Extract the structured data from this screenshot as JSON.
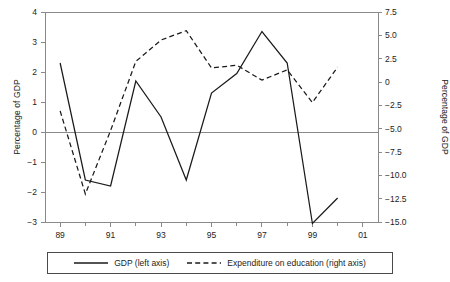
{
  "chart_data": {
    "type": "line",
    "title": "",
    "xlabel": "",
    "ylabel": "Percentage of GDP",
    "y2label": "Percentage of GDP",
    "grid": false,
    "legend_position": "bottom",
    "x": [
      1989,
      1990,
      1991,
      1992,
      1993,
      1994,
      1995,
      1996,
      1997,
      1998,
      1999,
      2000,
      2001
    ],
    "x_tick_labels": [
      "89",
      "91",
      "93",
      "95",
      "97",
      "99",
      "01"
    ],
    "x_tick_values": [
      1989,
      1991,
      1993,
      1995,
      1997,
      1999,
      2001
    ],
    "x_minor_tick_values": [
      1990,
      1992,
      1994,
      1996,
      1998,
      2000
    ],
    "xlim": [
      1988.4,
      2001.6
    ],
    "ylim": [
      -3,
      4
    ],
    "y_tick_labels": [
      "4",
      "3",
      "2",
      "1",
      "0",
      "-1",
      "-2",
      "-3"
    ],
    "y_tick_values": [
      4,
      3,
      2,
      1,
      0,
      -1,
      -2,
      -3
    ],
    "y2lim": [
      -15.0,
      7.5
    ],
    "y2_tick_labels": [
      "7.5",
      "5.0",
      "2.5",
      "0",
      "-2.5",
      "-5.0",
      "-7.5",
      "-10.0",
      "-12.5",
      "-15.0"
    ],
    "y2_tick_values": [
      7.5,
      5.0,
      2.5,
      0,
      -2.5,
      -5.0,
      -7.5,
      -10.0,
      -12.5,
      -15.0
    ],
    "zero_line_value": 0,
    "series": [
      {
        "name": "GDP (left axis)",
        "axis": "left",
        "style": "solid",
        "color": "#1a1a1a",
        "x": [
          1989,
          1990,
          1991,
          1992,
          1993,
          1994,
          1995,
          1996,
          1997,
          1998,
          1999,
          2000
        ],
        "values": [
          2.3,
          -1.6,
          -1.8,
          1.7,
          0.5,
          -1.6,
          1.3,
          1.95,
          3.35,
          2.3,
          -3.05,
          -2.2
        ]
      },
      {
        "name": "Expenditure on education (right axis)",
        "axis": "right",
        "style": "dashed",
        "color": "#1a1a1a",
        "x": [
          1989,
          1990,
          1991,
          1992,
          1993,
          1994,
          1995,
          1996,
          1997,
          1998,
          1999,
          2000
        ],
        "values": [
          -3.1,
          -12.0,
          -5.2,
          2.2,
          4.5,
          5.5,
          1.5,
          1.8,
          0.2,
          1.3,
          -2.2,
          1.6
        ]
      }
    ]
  },
  "legend": {
    "items": [
      {
        "label": "GDP (left axis)",
        "style": "solid"
      },
      {
        "label": "Expenditure on education (right axis)",
        "style": "dashed"
      }
    ]
  }
}
